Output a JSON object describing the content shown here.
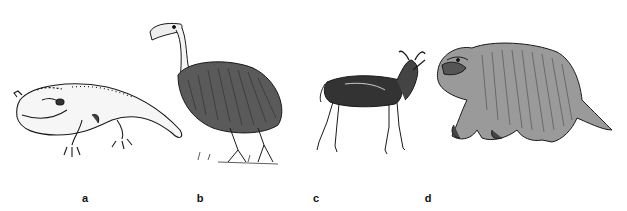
{
  "figure": {
    "panels": [
      {
        "id": "a",
        "label": "a",
        "subject": "giant-amphibian-illustration",
        "label_x": 85
      },
      {
        "id": "b",
        "label": "b",
        "subject": "giant-flightless-bird-illustration",
        "label_x": 200
      },
      {
        "id": "c",
        "label": "c",
        "subject": "antelope-illustration",
        "label_x": 316
      },
      {
        "id": "d",
        "label": "d",
        "subject": "ground-sloth-illustration",
        "label_x": 428
      }
    ],
    "colors": {
      "ink": "#1a1a1a",
      "background": "#ffffff"
    }
  }
}
